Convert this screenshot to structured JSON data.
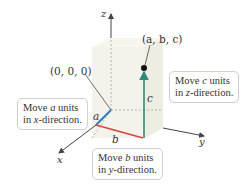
{
  "diagram": {
    "type": "3d-coordinate-plotting",
    "axes": {
      "x": "x",
      "y": "y",
      "z": "z"
    },
    "origin_label": "(0, 0, 0)",
    "point_label": "(a, b, c)",
    "segment_labels": {
      "a": "a",
      "b": "b",
      "c": "c"
    },
    "callouts": {
      "x_dir": {
        "line1_pre": "Move ",
        "var": "a",
        "line1_post": " units",
        "line2_pre": "in ",
        "axis": "x",
        "line2_post": "-direction."
      },
      "y_dir": {
        "line1_pre": "Move ",
        "var": "b",
        "line1_post": " units",
        "line2_pre": "in ",
        "axis": "y",
        "line2_post": "-direction."
      },
      "z_dir": {
        "line1_pre": "Move ",
        "var": "c",
        "line1_post": " units",
        "line2_pre": "in ",
        "axis": "z",
        "line2_post": "-direction."
      }
    },
    "colors": {
      "a_segment": "#2f7fc1",
      "b_segment": "#d9453a",
      "c_segment": "#2f8a78",
      "box_fill": "#f1f0e6",
      "axis": "#444444"
    }
  }
}
